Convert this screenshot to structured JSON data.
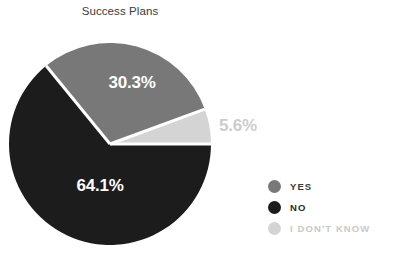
{
  "chart_data": {
    "type": "pie",
    "title": "Success Plans",
    "categories": [
      "YES",
      "NO",
      "I DON'T KNOW"
    ],
    "values": [
      30.3,
      64.1,
      5.6
    ],
    "labels": [
      "30.3%",
      "64.1%",
      "5.6%"
    ],
    "colors": [
      "#787878",
      "#1c1c1c",
      "#d4d4d4"
    ],
    "unit": "%",
    "legend_position": "right",
    "grid": false,
    "slices": [
      {
        "name": "YES",
        "value": 30.3,
        "label": "30.3%",
        "color": "#787878",
        "label_color": "#ffffff",
        "label_placement": "inside"
      },
      {
        "name": "NO",
        "value": 64.1,
        "label": "64.1%",
        "color": "#1c1c1c",
        "label_color": "#ffffff",
        "label_placement": "inside"
      },
      {
        "name": "I DON'T KNOW",
        "value": 5.6,
        "label": "5.6%",
        "color": "#d4d4d4",
        "label_color": "#c9c9c9",
        "label_placement": "outside"
      }
    ]
  },
  "title": {
    "text": "Success Plans",
    "color": "#3a3a3a"
  },
  "legend": {
    "items": [
      {
        "label": "YES",
        "color": "#787878",
        "text_color": "#3a3a3a"
      },
      {
        "label": "NO",
        "color": "#1c1c1c",
        "text_color": "#2a2a2a"
      },
      {
        "label": "I DON'T KNOW",
        "color": "#d4d4d4",
        "text_color": "#c9c9c9"
      }
    ]
  },
  "labels": {
    "yes_pct": "30.3%",
    "no_pct": "64.1%",
    "idk_pct": "5.6%"
  },
  "background": "#ffffff"
}
